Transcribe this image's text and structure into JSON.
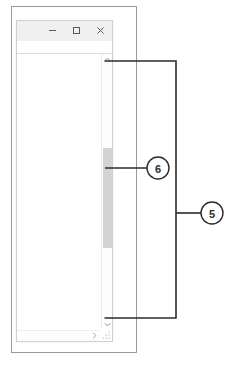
{
  "figure": {
    "kind": "annotated-screenshot-diagram",
    "line_color": "#2b2b2b",
    "frame_color": "#9a9a9a"
  },
  "outer_frame": {
    "name": "page-border"
  },
  "app_window": {
    "titlebar": {
      "background": "#f0f0f0",
      "buttons": [
        {
          "name": "minimize-button",
          "icon": "minimize-icon",
          "label": "–"
        },
        {
          "name": "maximize-button",
          "icon": "maximize-icon",
          "label": "□"
        },
        {
          "name": "close-button",
          "icon": "close-icon",
          "label": "✕"
        }
      ]
    },
    "content": {
      "text": ""
    },
    "vertical_scrollbar": {
      "up_arrow": {
        "icon": "chevron-up-icon",
        "glyph": "⌃"
      },
      "down_arrow": {
        "icon": "chevron-down-icon",
        "glyph": "⌄"
      },
      "thumb": {
        "name": "scrollbar-thumb",
        "color": "#d3d3d3"
      },
      "track_color": "#fdfdfd"
    },
    "horizontal_scrollbar": {
      "right_arrow": {
        "icon": "chevron-right-icon",
        "glyph": "›"
      }
    },
    "resize_grip": {
      "icon": "resize-grip-icon"
    }
  },
  "callouts": [
    {
      "id": "callout-6",
      "label": "6",
      "target": "scrollbar-thumb",
      "cx": 158,
      "cy": 168,
      "r": 11
    },
    {
      "id": "callout-5",
      "label": "5",
      "target": "vertical-scrollbar-track",
      "cx": 212,
      "cy": 213,
      "r": 11
    }
  ]
}
